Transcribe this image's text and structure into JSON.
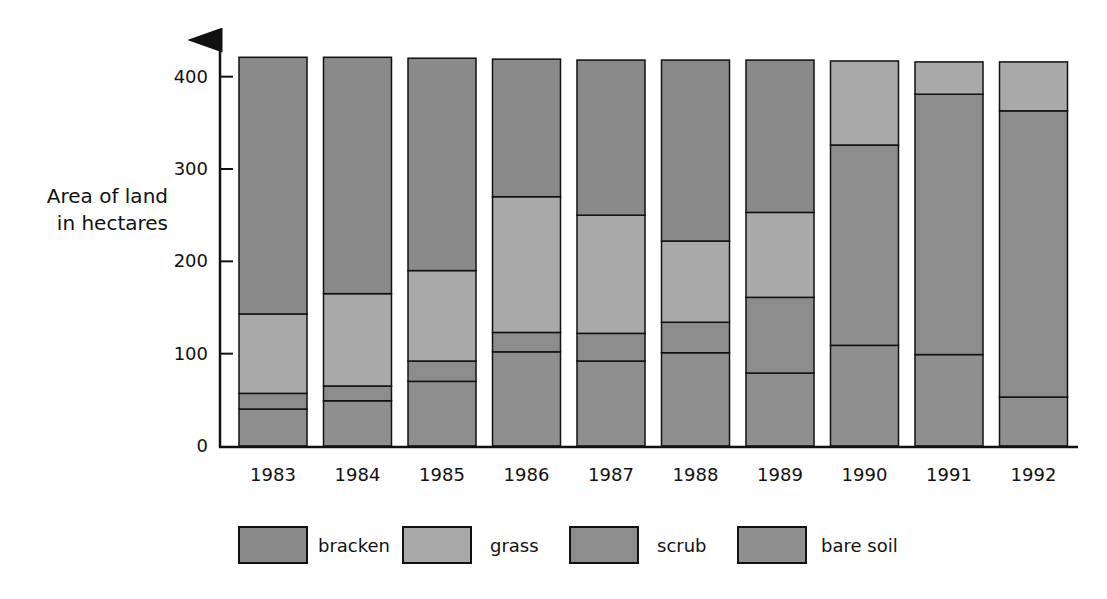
{
  "chart_data": {
    "type": "bar",
    "stacked": true,
    "title": "",
    "xlabel": "",
    "ylabel": "Area of land in hectares",
    "ylabel_lines": [
      "Area of land",
      "in hectares"
    ],
    "ylim": [
      0,
      430
    ],
    "yticks": [
      0,
      100,
      200,
      300,
      400
    ],
    "grid": false,
    "legend_position": "bottom",
    "categories": [
      "1983",
      "1984",
      "1985",
      "1986",
      "1987",
      "1988",
      "1989",
      "1990",
      "1991",
      "1992"
    ],
    "series": [
      {
        "name": "bare soil",
        "color": "#8f8f8f",
        "values": [
          40,
          49,
          70,
          102,
          92,
          101,
          79,
          109,
          99,
          53
        ]
      },
      {
        "name": "scrub",
        "color": "#8c8c8c",
        "values": [
          17,
          16,
          22,
          21,
          30,
          33,
          82,
          217,
          282,
          310
        ]
      },
      {
        "name": "grass",
        "color": "#a9a9a9",
        "values": [
          86,
          100,
          98,
          147,
          128,
          88,
          92,
          91,
          35,
          53
        ]
      },
      {
        "name": "bracken",
        "color": "#8a8a8a",
        "values": [
          278,
          256,
          230,
          149,
          168,
          196,
          165,
          0,
          0,
          0
        ]
      }
    ],
    "stack_order_bottom_to_top": [
      "bare soil",
      "scrub",
      "grass",
      "bracken"
    ],
    "legend": [
      {
        "label": "bracken",
        "color": "#8a8a8a"
      },
      {
        "label": "grass",
        "color": "#a9a9a9"
      },
      {
        "label": "scrub",
        "color": "#8c8c8c"
      },
      {
        "label": "bare soil",
        "color": "#8f8f8f"
      }
    ]
  },
  "layout": {
    "origin_x": 220,
    "origin_y": 446,
    "px_per_unit": 0.9233,
    "first_bar_x": 239,
    "bar_pitch": 84.5,
    "bar_width": 68,
    "axis_end_x": 1078
  }
}
